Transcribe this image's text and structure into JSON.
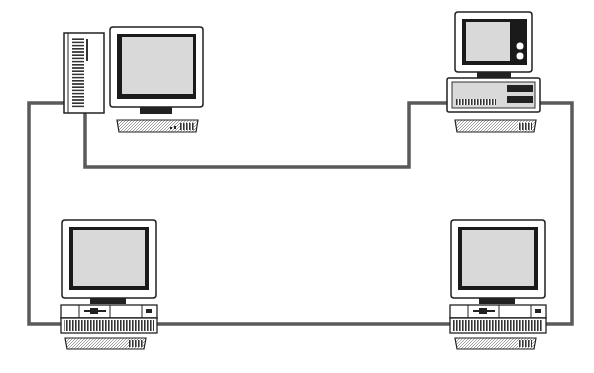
{
  "diagram": {
    "type": "network-ring",
    "colors": {
      "background": "#ffffff",
      "cable": "#5a5a5a",
      "outline": "#222222",
      "screen": "#d9d9d9",
      "bezel": "#1a1a1a"
    },
    "nodes": [
      {
        "id": "node-top-left",
        "kind": "tower-workstation",
        "position": "top-left"
      },
      {
        "id": "node-top-right",
        "kind": "desktop-workstation",
        "position": "top-right"
      },
      {
        "id": "node-bottom-left",
        "kind": "desktop-workstation",
        "position": "bottom-left"
      },
      {
        "id": "node-bottom-right",
        "kind": "desktop-workstation",
        "position": "bottom-right"
      }
    ],
    "links": [
      {
        "from": "node-top-left",
        "to": "node-top-right"
      },
      {
        "from": "node-top-right",
        "to": "node-bottom-right"
      },
      {
        "from": "node-bottom-right",
        "to": "node-bottom-left"
      },
      {
        "from": "node-bottom-left",
        "to": "node-top-left"
      }
    ]
  }
}
